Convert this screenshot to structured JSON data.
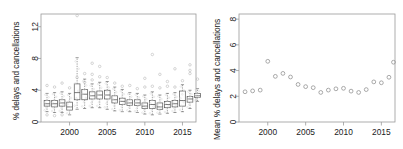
{
  "figure": {
    "background": "#ffffff",
    "axis_color": "#9a9a9a",
    "box_color": "#555555",
    "point_color": "#b9b9b9",
    "text_color": "#1a1a1a"
  },
  "chart_data": [
    {
      "type": "box",
      "panel": "left",
      "title": "",
      "xlabel": "",
      "ylabel": "% delays and cancellations",
      "xlim": [
        1996.2,
        2016.8
      ],
      "ylim": [
        0,
        13.6
      ],
      "yticks": [
        0,
        4,
        8,
        12
      ],
      "ytick_labels": [
        "0",
        "4",
        "8",
        "12"
      ],
      "xticks": [
        2000,
        2005,
        2010,
        2015
      ],
      "xtick_labels": [
        "2000",
        "2005",
        "2010",
        "2015"
      ],
      "grid": false,
      "legend": "none",
      "categories": [
        1997,
        1998,
        1999,
        2000,
        2001,
        2002,
        2003,
        2004,
        2005,
        2006,
        2007,
        2008,
        2009,
        2010,
        2011,
        2012,
        2013,
        2014,
        2015,
        2016
      ],
      "boxes": [
        {
          "year": 1997,
          "whislo": 1.3,
          "q1": 2.0,
          "med": 2.3,
          "q3": 2.7,
          "whishi": 3.6,
          "outliers": [
            4.6,
            0.9
          ]
        },
        {
          "year": 1998,
          "whislo": 1.2,
          "q1": 1.9,
          "med": 2.3,
          "q3": 2.7,
          "whishi": 3.7,
          "outliers": [
            4.4,
            0.8
          ]
        },
        {
          "year": 1999,
          "whislo": 1.2,
          "q1": 2.0,
          "med": 2.4,
          "q3": 2.8,
          "whishi": 3.8,
          "outliers": [
            4.9,
            0.9
          ]
        },
        {
          "year": 2000,
          "whislo": 0.9,
          "q1": 1.5,
          "med": 1.9,
          "q3": 2.5,
          "whishi": 3.6,
          "outliers": [
            4.3
          ]
        },
        {
          "year": 2001,
          "whislo": 1.6,
          "q1": 2.8,
          "med": 3.7,
          "q3": 4.8,
          "whishi": 8.1,
          "outliers": [
            13.4,
            5.6
          ]
        },
        {
          "year": 2002,
          "whislo": 1.7,
          "q1": 2.8,
          "med": 3.5,
          "q3": 4.1,
          "whishi": 5.4,
          "outliers": [
            6.1,
            5.0
          ]
        },
        {
          "year": 2003,
          "whislo": 1.8,
          "q1": 2.9,
          "med": 3.3,
          "q3": 3.8,
          "whishi": 4.8,
          "outliers": [
            7.4,
            6.0,
            5.3
          ]
        },
        {
          "year": 2004,
          "whislo": 1.8,
          "q1": 2.9,
          "med": 3.4,
          "q3": 3.9,
          "whishi": 5.0,
          "outliers": [
            7.0,
            5.7
          ]
        },
        {
          "year": 2005,
          "whislo": 1.6,
          "q1": 2.9,
          "med": 3.4,
          "q3": 4.0,
          "whishi": 5.1,
          "outliers": [
            5.6
          ]
        },
        {
          "year": 2006,
          "whislo": 1.4,
          "q1": 2.4,
          "med": 2.8,
          "q3": 3.3,
          "whishi": 4.4,
          "outliers": [
            4.9
          ]
        },
        {
          "year": 2007,
          "whislo": 1.3,
          "q1": 2.2,
          "med": 2.6,
          "q3": 3.0,
          "whishi": 4.1,
          "outliers": [
            4.5
          ]
        },
        {
          "year": 2008,
          "whislo": 1.3,
          "q1": 2.1,
          "med": 2.4,
          "q3": 2.8,
          "whishi": 3.7,
          "outliers": [
            4.6
          ]
        },
        {
          "year": 2009,
          "whislo": 1.2,
          "q1": 2.1,
          "med": 2.4,
          "q3": 2.8,
          "whishi": 3.6,
          "outliers": [
            4.2
          ]
        },
        {
          "year": 2010,
          "whislo": 1.0,
          "q1": 1.7,
          "med": 2.0,
          "q3": 2.4,
          "whishi": 3.4,
          "outliers": [
            5.5,
            4.4
          ]
        },
        {
          "year": 2011,
          "whislo": 0.9,
          "q1": 1.7,
          "med": 2.2,
          "q3": 2.7,
          "whishi": 3.8,
          "outliers": [
            8.5,
            4.5
          ]
        },
        {
          "year": 2012,
          "whislo": 1.0,
          "q1": 1.6,
          "med": 1.9,
          "q3": 2.4,
          "whishi": 3.4,
          "outliers": [
            6.0,
            4.3
          ]
        },
        {
          "year": 2013,
          "whislo": 1.1,
          "q1": 1.8,
          "med": 2.2,
          "q3": 2.6,
          "whishi": 3.6,
          "outliers": [
            5.1,
            4.5
          ]
        },
        {
          "year": 2014,
          "whislo": 1.2,
          "q1": 1.9,
          "med": 2.3,
          "q3": 2.7,
          "whishi": 3.7,
          "outliers": [
            6.7,
            4.4
          ]
        },
        {
          "year": 2015,
          "whislo": 1.3,
          "q1": 2.0,
          "med": 2.7,
          "q3": 3.9,
          "whishi": 4.7,
          "outliers": [
            5.2
          ]
        },
        {
          "year": 2016,
          "whislo": 1.7,
          "q1": 2.5,
          "med": 2.9,
          "q3": 3.2,
          "whishi": 4.0,
          "outliers": [
            7.2,
            6.5,
            6.1
          ]
        },
        {
          "year": 2017,
          "whislo": 2.6,
          "q1": 3.1,
          "med": 3.3,
          "q3": 3.6,
          "whishi": 4.2,
          "outliers": [
            5.4
          ]
        }
      ]
    },
    {
      "type": "scatter",
      "panel": "right",
      "title": "",
      "xlabel": "",
      "ylabel": "Mean % delays and cancellations",
      "xlim": [
        1996.2,
        2016.8
      ],
      "ylim": [
        0,
        8.4
      ],
      "yticks": [
        0,
        2,
        4,
        6,
        8
      ],
      "ytick_labels": [
        "0",
        "2",
        "4",
        "6",
        "8"
      ],
      "xticks": [
        2000,
        2005,
        2010,
        2015
      ],
      "xtick_labels": [
        "2000",
        "2005",
        "2010",
        "2015"
      ],
      "grid": false,
      "legend": "none",
      "x": [
        1997,
        1998,
        1999,
        2000,
        2001,
        2002,
        2003,
        2004,
        2005,
        2006,
        2007,
        2008,
        2009,
        2010,
        2011,
        2012,
        2013,
        2014,
        2015,
        2016
      ],
      "y": [
        2.35,
        2.42,
        2.48,
        4.72,
        3.55,
        3.78,
        3.5,
        2.92,
        2.75,
        2.67,
        2.3,
        2.48,
        2.58,
        2.62,
        2.4,
        2.3,
        2.52,
        3.12,
        3.05,
        3.48
      ],
      "last_point": {
        "x": 2016.6,
        "y": 4.65
      }
    }
  ]
}
